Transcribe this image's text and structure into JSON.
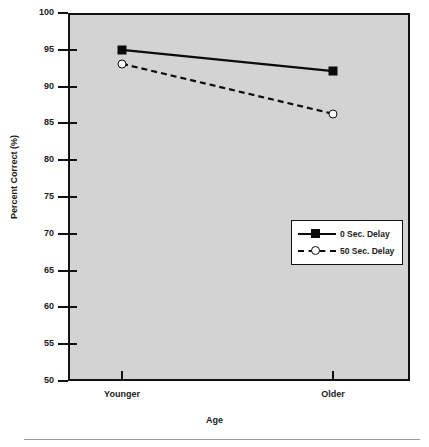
{
  "chart_data": {
    "type": "line",
    "title": "",
    "subtitle": "",
    "xlabel": "Age",
    "ylabel": "Percent Correct (%)",
    "categories": [
      "Younger",
      "Older"
    ],
    "ylim": [
      50,
      100
    ],
    "yticks": [
      50,
      55,
      60,
      65,
      70,
      75,
      80,
      85,
      90,
      95,
      100
    ],
    "ytick_labels": [
      "50",
      "55",
      "60",
      "65",
      "70",
      "75",
      "80",
      "85",
      "90",
      "95",
      "100"
    ],
    "grid": false,
    "legend_position": "center-right",
    "series": [
      {
        "name": "0 Sec. Delay",
        "values": [
          95.0,
          92.1
        ],
        "marker": "filled-square",
        "linestyle": "solid",
        "color": "#0b0b0b"
      },
      {
        "name": "50 Sec. Delay",
        "values": [
          93.1,
          86.3
        ],
        "marker": "open-circle",
        "linestyle": "dashed",
        "color": "#0b0b0b"
      }
    ],
    "plot_background": "#d3d3d3",
    "page_background": "#ffffff",
    "axis_color": "#111111"
  },
  "axes": {
    "y_title": "Percent Correct (%)",
    "x_title": "Age",
    "y_ticks": [
      {
        "label": "100",
        "value": 100
      },
      {
        "label": "95",
        "value": 95
      },
      {
        "label": "90",
        "value": 90
      },
      {
        "label": "85",
        "value": 85
      },
      {
        "label": "80",
        "value": 80
      },
      {
        "label": "75",
        "value": 75
      },
      {
        "label": "70",
        "value": 70
      },
      {
        "label": "65",
        "value": 65
      },
      {
        "label": "60",
        "value": 60
      },
      {
        "label": "55",
        "value": 55
      },
      {
        "label": "50",
        "value": 50
      }
    ],
    "x_ticks": [
      {
        "label": "Younger"
      },
      {
        "label": "Older"
      }
    ]
  },
  "legend": {
    "entries": [
      {
        "label": "0 Sec. Delay",
        "marker": "filled-square-icon",
        "line": "solid"
      },
      {
        "label": "50 Sec. Delay",
        "marker": "open-circle-icon",
        "line": "dashed"
      }
    ]
  }
}
